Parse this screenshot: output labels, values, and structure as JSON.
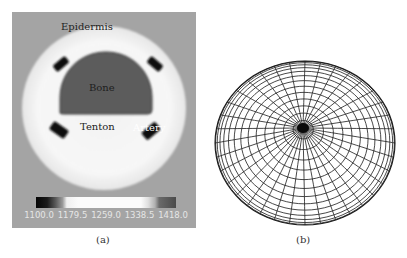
{
  "figure_a": {
    "caption": "(a)",
    "labels": {
      "epidermis": "Epidermis",
      "bone": "Bone",
      "tendon": "Tenton",
      "artery": "Artery"
    },
    "colorbar": {
      "min": 1100.0,
      "max": 1418.0,
      "ticks": [
        "1100.0",
        "1179.5",
        "1259.0",
        "1338.5",
        "1418.0"
      ]
    },
    "colors": {
      "background": "#a4a4a4",
      "tissue": "#f4f4f4",
      "bone": "#5a5a5a",
      "vessel": "#111111"
    }
  },
  "figure_b": {
    "caption": "(b)",
    "description": "hemispherical finite-element mesh with radial spokes converging at a dense hub",
    "mesh": {
      "rings": 14,
      "spokes": 36
    },
    "colors": {
      "line": "#1a1a1a"
    }
  }
}
